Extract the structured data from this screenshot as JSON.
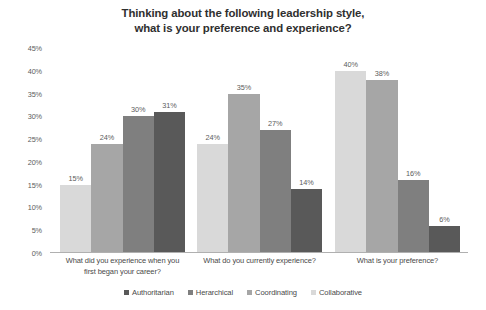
{
  "chart_data": {
    "type": "bar",
    "title": "Thinking about the following leadership style, what is your preference and experience?",
    "title_lines": [
      "Thinking about the following leadership style,",
      "what is your preference and experience?"
    ],
    "xlabel": "",
    "ylabel": "",
    "ylim": [
      0,
      45
    ],
    "grid": false,
    "legend_position": "bottom",
    "ytick_labels": [
      "45%",
      "40%",
      "35%",
      "30%",
      "25%",
      "20%",
      "15%",
      "10%",
      "5%",
      "0%"
    ],
    "ytick_values": [
      45,
      40,
      35,
      30,
      25,
      20,
      15,
      10,
      5,
      0
    ],
    "categories": [
      "What did you experience when you first began your career?",
      "What do you currently experience?",
      "What is your preference?"
    ],
    "category_lines": [
      [
        "What did you experience when you",
        "first began your career?"
      ],
      [
        "What do you currently experience?"
      ],
      [
        "What is your preference?"
      ]
    ],
    "series": [
      {
        "name": "Collaborative",
        "color": "#d9d9d9",
        "values": [
          15,
          24,
          40
        ],
        "labels": [
          "15%",
          "24%",
          "40%"
        ]
      },
      {
        "name": "Coordinating",
        "color": "#a6a6a6",
        "values": [
          24,
          35,
          38
        ],
        "labels": [
          "24%",
          "35%",
          "38%"
        ]
      },
      {
        "name": "Herarchical",
        "color": "#7f7f7f",
        "values": [
          30,
          27,
          16
        ],
        "labels": [
          "30%",
          "27%",
          "16%"
        ]
      },
      {
        "name": "Authoritarian",
        "color": "#595959",
        "values": [
          31,
          14,
          6
        ],
        "labels": [
          "31%",
          "14%",
          "6%"
        ]
      }
    ],
    "legend_entries": [
      {
        "label": "Authoritarian",
        "color": "#595959"
      },
      {
        "label": "Herarchical",
        "color": "#7f7f7f"
      },
      {
        "label": "Coordinating",
        "color": "#a6a6a6"
      },
      {
        "label": "Collaborative",
        "color": "#d9d9d9"
      }
    ],
    "axis_color": "#b0b0b0",
    "text_color": "#4a4a4a",
    "background": "#ffffff"
  }
}
